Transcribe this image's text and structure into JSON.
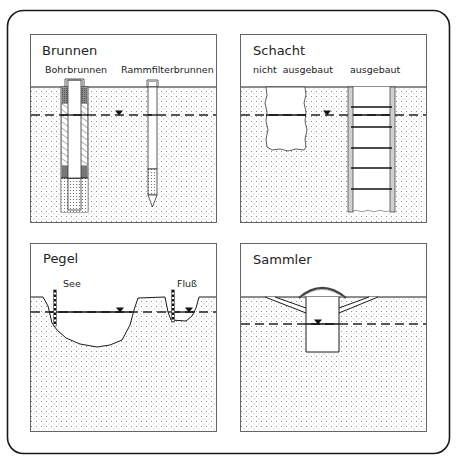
{
  "panels": {
    "brunnen": {
      "title": "Brunnen",
      "labels": [
        "Bohrbrunnen",
        "Rammfilterbrunnen"
      ]
    },
    "schacht": {
      "title": "Schacht",
      "labels": [
        "nicht  ausgebaut",
        "ausgebaut"
      ]
    },
    "pegel": {
      "title": "Pegel",
      "labels": [
        "See",
        "Fluß"
      ]
    },
    "sammler": {
      "title": "Sammler",
      "labels": []
    }
  },
  "symbols": {
    "water_level": "groundwater-level-triangle"
  },
  "colors": {
    "line": "#1a1a1a",
    "soil_dots": "#9a9a9a",
    "seal": "#6a6a6a",
    "background": "#ffffff"
  }
}
